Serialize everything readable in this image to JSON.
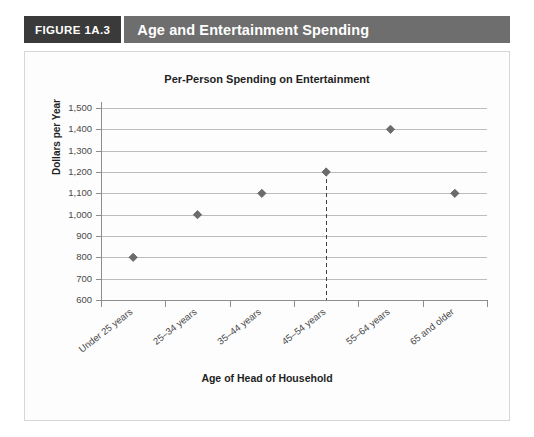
{
  "header": {
    "figure_tag": "FIGURE 1A.3",
    "title": "Age and Entertainment Spending"
  },
  "colors": {
    "tag_background": "#3a3a3a",
    "title_background": "#6e6e6e",
    "panel_background": "#fdfdfd",
    "panel_border": "#d7d7d7",
    "marker": "#6b6b6b",
    "gridline": "#bcbcbc",
    "axis": "#8d8d8d",
    "reference_line": "#3f3f3f"
  },
  "chart_data": {
    "type": "scatter",
    "title": "Per-Person Spending on Entertainment",
    "xlabel": "Age of Head of Household",
    "ylabel": "Dollars per Year",
    "categories": [
      "Under 25 years",
      "25–34 years",
      "35–44 years",
      "45–54 years",
      "55–64 years",
      "65 and older"
    ],
    "values": [
      800,
      1000,
      1100,
      1200,
      1400,
      1100
    ],
    "ylim": [
      600,
      1500
    ],
    "ytick_values": [
      600,
      700,
      800,
      900,
      1000,
      1100,
      1200,
      1300,
      1400,
      1500
    ],
    "ytick_labels": [
      "600",
      "700",
      "800",
      "900",
      "1,000",
      "1,100",
      "1,200",
      "1,300",
      "1,400",
      "1,500"
    ],
    "grid": true,
    "legend": null,
    "marker_shape": "diamond",
    "annotations": [
      {
        "type": "vertical-dashed-reference-line",
        "at_category": "45–54 years",
        "from_value": 1200,
        "to_value": 600
      }
    ]
  }
}
